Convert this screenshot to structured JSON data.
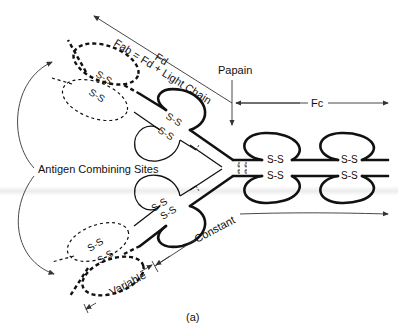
{
  "figure": {
    "panel_label": "(a)"
  },
  "labels": {
    "fd": "Fd",
    "fab": "Fab = Fd + Light Chain",
    "papain": "Papain",
    "fc": "Fc",
    "antigen_sites": "Antigen Combining Sites",
    "constant": "Constant",
    "variable": "Variable"
  },
  "disulfide_label": "S-S",
  "interchain_bond_glyph": "S",
  "regions": [
    {
      "name": "Fab",
      "definition": "Fd + Light Chain"
    },
    {
      "name": "Fc",
      "definition": "Fragment crystallizable"
    },
    {
      "name": "Variable",
      "style": "dashed"
    },
    {
      "name": "Constant",
      "style": "solid"
    }
  ]
}
